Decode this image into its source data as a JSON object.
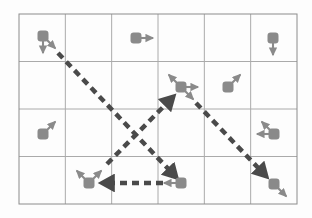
{
  "figure": {
    "background_color": "#fdfdfd",
    "grid": {
      "columns": 6,
      "rows": 4,
      "x0": 19,
      "y0": 14,
      "x1": 297,
      "y1": 204,
      "line_color": "#aaaaaa",
      "border_color": "#8c8c8c",
      "line_width": 1
    },
    "style": {
      "node_color": "#8a8a8a",
      "node_arrow_color": "#8a8a8a",
      "path_color": "#4a4a4a",
      "node_size": 11,
      "node_arrow_length": 17,
      "dash_pattern": "7 5",
      "path_width": 4.5
    },
    "nodes": [
      {
        "id": "node-r1c1",
        "name": "agent-top-left",
        "row": 1,
        "col": 1,
        "cx": 43,
        "cy": 36,
        "arrows": [
          "down",
          "down-right"
        ]
      },
      {
        "id": "node-r1c3",
        "name": "agent-top-center",
        "row": 1,
        "col": 3,
        "cx": 136,
        "cy": 38,
        "arrows": [
          "right"
        ]
      },
      {
        "id": "node-r1c6",
        "name": "agent-top-right",
        "row": 1,
        "col": 6,
        "cx": 273,
        "cy": 38,
        "arrows": [
          "down"
        ]
      },
      {
        "id": "node-r2c4",
        "name": "agent-center-hub",
        "row": 2,
        "col": 4,
        "cx": 181,
        "cy": 87,
        "arrows": [
          "up-left",
          "right",
          "down-right"
        ]
      },
      {
        "id": "node-r2c5",
        "name": "agent-middle-right",
        "row": 2,
        "col": 5,
        "cx": 228,
        "cy": 87,
        "arrows": [
          "up-right"
        ]
      },
      {
        "id": "node-r3c1",
        "name": "agent-lower-left",
        "row": 3,
        "col": 1,
        "cx": 43,
        "cy": 134,
        "arrows": [
          "up-right"
        ]
      },
      {
        "id": "node-r3c6",
        "name": "agent-lower-right",
        "row": 3,
        "col": 6,
        "cx": 274,
        "cy": 134,
        "arrows": [
          "up-left",
          "left"
        ]
      },
      {
        "id": "node-r4c2",
        "name": "agent-bottom-left",
        "row": 4,
        "col": 2,
        "cx": 89,
        "cy": 183,
        "arrows": [
          "up-left",
          "up-right"
        ]
      },
      {
        "id": "node-r4c4",
        "name": "agent-bottom-center",
        "row": 4,
        "col": 4,
        "cx": 181,
        "cy": 183,
        "arrows": [
          "left"
        ]
      },
      {
        "id": "node-r4c6",
        "name": "agent-bottom-right",
        "row": 4,
        "col": 6,
        "cx": 274,
        "cy": 184,
        "arrows": [
          "down-right"
        ]
      }
    ],
    "paths": [
      {
        "id": "path-topleft-to-bottomcenter",
        "name": "dashed-path-descending-left",
        "from": [
          58,
          53
        ],
        "to": [
          175,
          176
        ],
        "arrowhead": true
      },
      {
        "id": "path-bottomleft-to-hub",
        "name": "dashed-path-ascending",
        "from": [
          107,
          164
        ],
        "to": [
          172,
          98
        ],
        "arrowhead": true
      },
      {
        "id": "path-hub-to-bottomright",
        "name": "dashed-path-descending-right",
        "from": [
          196,
          103
        ],
        "to": [
          265,
          175
        ],
        "arrowhead": true
      },
      {
        "id": "path-bottomcenter-to-bottomleft",
        "name": "dashed-path-horizontal",
        "from": [
          163,
          183
        ],
        "to": [
          104,
          183
        ],
        "arrowhead": true
      }
    ]
  }
}
